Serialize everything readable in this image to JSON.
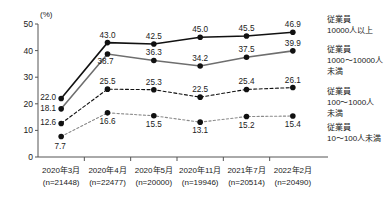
{
  "chart_data": {
    "type": "line",
    "title": "",
    "xlabel": "",
    "ylabel": "(%)",
    "ylim": [
      0,
      50
    ],
    "yticks": [
      "0",
      "10",
      "20",
      "30",
      "40",
      "50"
    ],
    "grid": false,
    "legend_position": "right",
    "categories": [
      "2020年3月",
      "2020年4月",
      "2020年5月",
      "2020年11月",
      "2021年7月",
      "2022年2月"
    ],
    "category_sublabels": [
      "(n=21448)",
      "(n=22477)",
      "(n=20000)",
      "(n=19946)",
      "(n=20514)",
      "(n=20490)"
    ],
    "series": [
      {
        "name": "従業員\n10000人以上",
        "legend_lines": [
          "従業員",
          "10000人以上"
        ],
        "values": [
          22.0,
          43.0,
          42.5,
          45.0,
          45.5,
          46.9
        ],
        "color": "#111111",
        "style": "solid"
      },
      {
        "name": "従業員\n1000～10000人\n未満",
        "legend_lines": [
          "従業員",
          "1000～10000人",
          "未満"
        ],
        "values": [
          18.1,
          38.7,
          36.3,
          34.2,
          37.5,
          39.9
        ],
        "color": "#6e6e6e",
        "style": "solid"
      },
      {
        "name": "従業員\n100～1000人\n未満",
        "legend_lines": [
          "従業員",
          "100～1000人",
          "未満"
        ],
        "values": [
          12.6,
          25.5,
          25.3,
          22.5,
          25.4,
          26.1
        ],
        "color": "#111111",
        "style": "dashed"
      },
      {
        "name": "従業員\n10～100人未満",
        "legend_lines": [
          "従業員",
          "10～100人未満"
        ],
        "values": [
          7.7,
          16.6,
          15.5,
          13.1,
          15.2,
          15.4
        ],
        "color": "#8a8a8a",
        "style": "dashed"
      }
    ],
    "point_labels": [
      [
        "22.0",
        "43.0",
        "42.5",
        "45.0",
        "45.5",
        "46.9"
      ],
      [
        "18.1",
        "38.7",
        "36.3",
        "34.2",
        "37.5",
        "39.9"
      ],
      [
        "12.6",
        "25.5",
        "25.3",
        "22.5",
        "25.4",
        "26.1"
      ],
      [
        "7.7",
        "16.6",
        "15.5",
        "13.1",
        "15.2",
        "15.4"
      ]
    ]
  },
  "axis": {
    "unit_label": "(%)"
  },
  "legend": {
    "items": [
      {
        "line1": "従業員",
        "line2": "10000人以上",
        "line3": ""
      },
      {
        "line1": "従業員",
        "line2": "1000～10000人",
        "line3": "未満"
      },
      {
        "line1": "従業員",
        "line2": "100～1000人",
        "line3": "未満"
      },
      {
        "line1": "従業員",
        "line2": "10～100人未満",
        "line3": ""
      }
    ]
  }
}
